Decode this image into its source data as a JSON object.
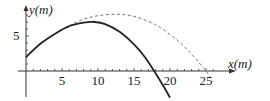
{
  "chart_data": {
    "type": "line",
    "title": "",
    "xlabel": "x(m)",
    "ylabel": "y(m)",
    "x_axis": {
      "ticks_minor_step": 1,
      "tick_labels": [
        "5",
        "10",
        "15",
        "20",
        "25"
      ],
      "range": [
        0,
        27
      ]
    },
    "y_axis": {
      "ticks_minor_step": 1,
      "tick_labels": [
        "5"
      ],
      "range": [
        -4,
        9
      ]
    },
    "grid": false,
    "series": [
      {
        "name": "trajectory with air resistance",
        "style": "solid",
        "color": "#222222",
        "points": [
          [
            0,
            2
          ],
          [
            2,
            3.9
          ],
          [
            4,
            5.3
          ],
          [
            6,
            6.4
          ],
          [
            8,
            6.9
          ],
          [
            9.5,
            7
          ],
          [
            11,
            6.7
          ],
          [
            13,
            5.6
          ],
          [
            15,
            3.8
          ],
          [
            16.5,
            2
          ],
          [
            17.8,
            0
          ],
          [
            19,
            -2
          ],
          [
            20,
            -3.8
          ]
        ]
      },
      {
        "name": "trajectory without air resistance",
        "style": "dashed",
        "color": "#666666",
        "points": [
          [
            6,
            6.5
          ],
          [
            8,
            7.4
          ],
          [
            10,
            7.9
          ],
          [
            12.5,
            8.1
          ],
          [
            15,
            7.8
          ],
          [
            18,
            6.6
          ],
          [
            21,
            4.4
          ],
          [
            23,
            2.4
          ],
          [
            25,
            0
          ],
          [
            26,
            -1.5
          ]
        ]
      }
    ]
  },
  "labels": {
    "y_axis": "y(m)",
    "x_axis": "x(m)",
    "y_tick_5": "5",
    "x_ticks": [
      "5",
      "10",
      "15",
      "20",
      "25"
    ]
  }
}
